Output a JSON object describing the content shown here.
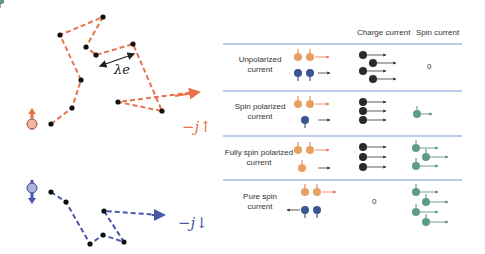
{
  "colors": {
    "up": "#e8734a",
    "down": "#4a56a8",
    "charge": "#222222",
    "spin": "#4f8c7a",
    "divider": "#7a9bd0"
  },
  "left": {
    "lambda_label": "λe",
    "j_up_label": "−j↑",
    "j_down_label": "−j↓"
  },
  "table": {
    "headers": {
      "charge": "Charge current",
      "spin": "Spin current"
    },
    "rows": [
      {
        "label_line1": "Unpolarized",
        "label_line2": "current",
        "charge_value": "",
        "spin_value": "0"
      },
      {
        "label_line1": "Spin polarized",
        "label_line2": "current",
        "charge_value": "",
        "spin_value": ""
      },
      {
        "label_line1": "Fully spin polarized",
        "label_line2": "current",
        "charge_value": "",
        "spin_value": ""
      },
      {
        "label_line1": "Pure spin",
        "label_line2": "current",
        "charge_value": "0",
        "spin_value": ""
      }
    ]
  }
}
